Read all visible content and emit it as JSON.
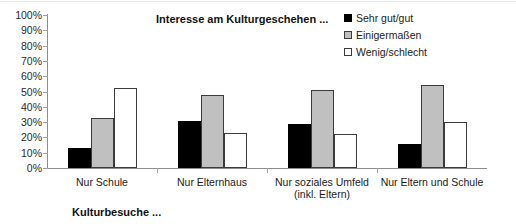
{
  "chart_data": {
    "type": "bar",
    "title": "Interesse am Kulturgeschehen ...",
    "xlabel": "Kulturbesuche ...",
    "ylabel": "",
    "ylim": [
      0,
      100
    ],
    "grid": false,
    "legend_position": "top-right",
    "categories": [
      "Nur Schule",
      "Nur Elternhaus",
      "Nur soziales Umfeld",
      "Nur Eltern und Schule"
    ],
    "category_lines": [
      [
        "Nur Schule"
      ],
      [
        "Nur Elternhaus"
      ],
      [
        "Nur soziales Umfeld",
        "(inkl. Eltern)"
      ],
      [
        "Nur Eltern und Schule"
      ]
    ],
    "series": [
      {
        "name": "Sehr gut/gut",
        "color": "#000000",
        "values": [
          13,
          31,
          29,
          16
        ]
      },
      {
        "name": "Einigermaßen",
        "color": "#c0c0c0",
        "values": [
          33,
          48,
          51,
          54
        ]
      },
      {
        "name": "Wenig/schlecht",
        "color": "#ffffff",
        "values": [
          52,
          23,
          22,
          30
        ]
      }
    ],
    "ytick_labels": [
      "100%",
      "90%",
      "80%",
      "70%",
      "60%",
      "50%",
      "40%",
      "30%",
      "20%",
      "10%",
      "0%"
    ],
    "ytick_values": [
      100,
      90,
      80,
      70,
      60,
      50,
      40,
      30,
      20,
      10,
      0
    ]
  }
}
